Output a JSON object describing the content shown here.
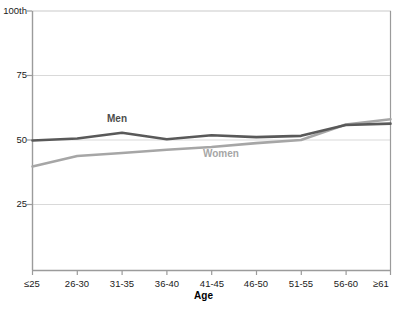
{
  "chart_data": {
    "type": "line",
    "title": "",
    "subtitle": "",
    "xlabel": "Age",
    "ylabel": "",
    "categories": [
      "≤25",
      "26-30",
      "31-35",
      "36-40",
      "41-45",
      "46-50",
      "51-55",
      "56-60",
      "≥61"
    ],
    "ylim": [
      0,
      100
    ],
    "yticks": [
      25,
      50,
      75,
      100
    ],
    "ytick_labels": [
      "25",
      "50",
      "75",
      "100th"
    ],
    "grid": "horizontal",
    "legend": "inline-annotations",
    "series": [
      {
        "name": "Men",
        "color": "#595959",
        "values": [
          50.0,
          50.8,
          53.0,
          50.5,
          52.0,
          51.3,
          51.8,
          56.0,
          56.5
        ]
      },
      {
        "name": "Women",
        "color": "#a6a6a6",
        "values": [
          40.0,
          44.0,
          45.2,
          46.4,
          47.5,
          49.0,
          50.2,
          56.2,
          58.2
        ]
      }
    ],
    "annotations": [
      {
        "text": "Men",
        "series": "Men"
      },
      {
        "text": "Women",
        "series": "Women"
      }
    ]
  },
  "axis": {
    "x_title": "Age",
    "y_tick_labels": [
      "100th",
      "75",
      "50",
      "25"
    ],
    "x_tick_labels": [
      "≤25",
      "26-30",
      "31-35",
      "36-40",
      "41-45",
      "46-50",
      "51-55",
      "56-60",
      "≥61"
    ]
  },
  "colors": {
    "men_line": "#595959",
    "women_line": "#a6a6a6",
    "grid": "#d9d9d9",
    "axis": "#808080",
    "text": "#1a1a1a"
  }
}
